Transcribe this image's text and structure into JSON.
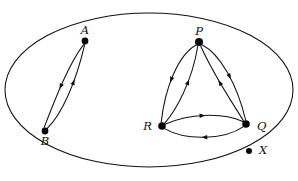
{
  "figure": {
    "kind": "directed-graph-diagram",
    "background_color": "#ffffff",
    "ink_color": "#101010",
    "width": 298,
    "height": 181
  },
  "boundary": {
    "name": "universe-ellipse",
    "shape": "ellipse",
    "cx": 149,
    "cy": 90,
    "rx": 144,
    "ry": 77
  },
  "vertices": [
    {
      "id": "A",
      "label": "A",
      "x": 85,
      "y": 41,
      "r": 3.4,
      "label_dx": 0,
      "label_dy": -10,
      "anchor": "middle"
    },
    {
      "id": "B",
      "label": "B",
      "x": 45,
      "y": 131,
      "r": 3.4,
      "label_dx": 0,
      "label_dy": 11,
      "anchor": "middle"
    },
    {
      "id": "P",
      "label": "P",
      "x": 199,
      "y": 42,
      "r": 4.0,
      "label_dx": 0,
      "label_dy": -10,
      "anchor": "middle"
    },
    {
      "id": "Q",
      "label": "Q",
      "x": 246,
      "y": 124,
      "r": 3.8,
      "label_dx": 11,
      "label_dy": 3,
      "anchor": "start"
    },
    {
      "id": "R",
      "label": "R",
      "x": 162,
      "y": 126,
      "r": 3.8,
      "label_dx": -10,
      "label_dy": 1,
      "anchor": "end"
    },
    {
      "id": "X",
      "label": "X",
      "x": 249,
      "y": 151,
      "r": 3.0,
      "label_dx": 10,
      "label_dy": 0,
      "anchor": "start"
    }
  ],
  "edges": [
    {
      "id": "A-to-B",
      "from": "A",
      "to": "B",
      "label": "A to B",
      "curve": "outer-left",
      "path": "M 83.6 44.6 C 70 62 57 94 44.2 127.4",
      "arrow_t": 0.52,
      "arrow_size": 5.2
    },
    {
      "id": "B-to-A",
      "from": "B",
      "to": "A",
      "label": "B to A",
      "curve": "inner-right",
      "path": "M 47.0 128.6 C 62 114 76 82 84.6 44.8",
      "arrow_t": 0.58,
      "arrow_size": 5.2
    },
    {
      "id": "P-to-R",
      "from": "P",
      "to": "R",
      "label": "P to R",
      "curve": "outer-left",
      "path": "M 196.2 45.0 C 178 55 165 88 161.2 122.2",
      "arrow_t": 0.5,
      "arrow_size": 5.2
    },
    {
      "id": "R-to-P",
      "from": "R",
      "to": "P",
      "label": "R to P",
      "curve": "inner",
      "path": "M 164.6 123.4 C 176 110 192 82 197.8 46.0",
      "arrow_t": 0.56,
      "arrow_size": 5.2
    },
    {
      "id": "P-to-Q",
      "from": "P",
      "to": "Q",
      "label": "P to Q",
      "curve": "outer-right",
      "path": "M 202.0 44.8 C 220 54 237 84 245.6 120.0",
      "arrow_t": 0.48,
      "arrow_size": 5.2
    },
    {
      "id": "Q-to-P",
      "from": "Q",
      "to": "P",
      "label": "Q to P",
      "curve": "inner",
      "path": "M 243.6 121.0 C 232 102 214 76 200.6 45.8",
      "arrow_t": 0.52,
      "arrow_size": 5.2
    },
    {
      "id": "R-to-Q",
      "from": "R",
      "to": "Q",
      "label": "R to Q",
      "curve": "upper",
      "path": "M 165.6 124.0 C 188 114 222 112 242.8 121.6",
      "arrow_t": 0.48,
      "arrow_size": 5.2
    },
    {
      "id": "Q-to-R",
      "from": "Q",
      "to": "R",
      "label": "Q to R",
      "curve": "lower",
      "path": "M 243.6 126.6 C 224 140 186 141 164.6 128.6",
      "arrow_t": 0.5,
      "arrow_size": 5.2
    }
  ],
  "components": [
    {
      "name": "component-AB",
      "members": [
        "A",
        "B"
      ]
    },
    {
      "name": "component-PQR",
      "members": [
        "P",
        "Q",
        "R"
      ]
    },
    {
      "name": "component-X",
      "members": [
        "X"
      ]
    }
  ]
}
